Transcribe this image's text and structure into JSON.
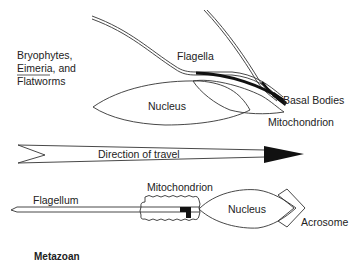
{
  "top_panel": {
    "group_label_line1": "Bryophytes,",
    "group_label_line2_italic": "Eimeria",
    "group_label_line2_rest": ", and",
    "group_label_line3": "Flatworms",
    "flagella_label": "Flagella",
    "nucleus_label": "Nucleus",
    "basal_bodies_label": "Basal Bodies",
    "mitochondrion_label": "Mitochondrion"
  },
  "arrow": {
    "label": "Direction of travel"
  },
  "bottom_panel": {
    "flagellum_label": "Flagellum",
    "mitochondrion_label": "Mitochondrion",
    "nucleus_label": "Nucleus",
    "acrosome_label": "Acrosome",
    "group_label": "Metazoan"
  },
  "colors": {
    "line": "#333333",
    "fill_dark": "#111111",
    "background": "#ffffff"
  }
}
